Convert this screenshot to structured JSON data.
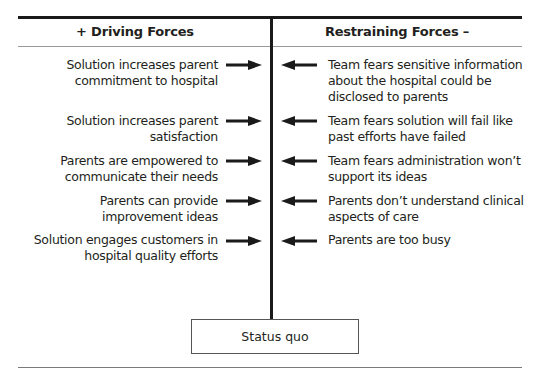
{
  "diagram": {
    "type": "force-field-analysis",
    "headers": {
      "driving": "+ Driving Forces",
      "restraining": "Restraining Forces –"
    },
    "driving_forces": [
      {
        "line1": "Solution increases parent",
        "line2": "commitment to hospital"
      },
      {
        "line1": "Solution increases parent",
        "line2": "satisfaction"
      },
      {
        "line1": "Parents are empowered to",
        "line2": "communicate their needs"
      },
      {
        "line1": "Parents can provide",
        "line2": "improvement ideas"
      },
      {
        "line1": "Solution engages customers in",
        "line2": "hospital quality efforts"
      }
    ],
    "restraining_forces": [
      {
        "line1": "Team fears sensitive information",
        "line2": "about the hospital could be",
        "line3": "disclosed to parents"
      },
      {
        "line1": "Team fears solution will fail like",
        "line2": "past efforts have failed"
      },
      {
        "line1": "Team fears administration won’t",
        "line2": "support its ideas"
      },
      {
        "line1": "Parents don’t understand clinical",
        "line2": "aspects of care"
      },
      {
        "line1": "Parents are too busy"
      }
    ],
    "center_label": "Status quo",
    "colors": {
      "ink": "#1a1a1a",
      "text": "#231f20",
      "rule": "#9a9a9a"
    }
  }
}
